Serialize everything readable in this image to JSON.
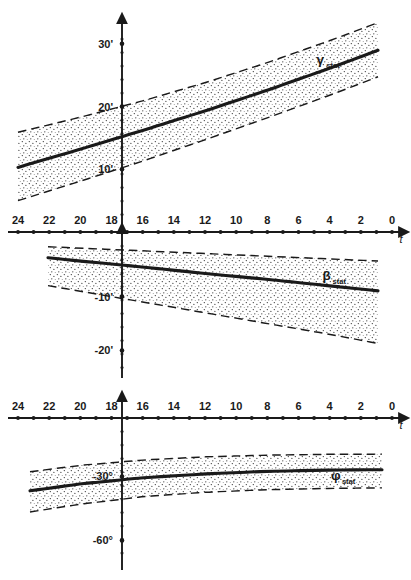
{
  "figure": {
    "background": "#ffffff",
    "ink": "#1a1a1a",
    "panel_count": 3
  },
  "chart_data": [
    {
      "type": "line",
      "name": "gamma-stat-panel",
      "title": "",
      "xlabel": "t",
      "ylabel": "",
      "series_label": "γ",
      "series_label_sub": "stat",
      "xlim": [
        24,
        0
      ],
      "ylim": [
        0,
        33
      ],
      "x_reversed": true,
      "grid": false,
      "legend_position": "inline-right",
      "y_unit": "arcminute",
      "y_ticks": [
        10,
        20,
        30
      ],
      "y_tick_labels": [
        "10'",
        "20'",
        "30'"
      ],
      "x_ticks": [
        24,
        23,
        22,
        21,
        20,
        19,
        18,
        17,
        16,
        15,
        14,
        13,
        12,
        11,
        10,
        9,
        8,
        7,
        6,
        5,
        4,
        3,
        2,
        1,
        0
      ],
      "x_tick_labels_shown": [
        24,
        22,
        20,
        18,
        16,
        14,
        12,
        10,
        8,
        6,
        4,
        2,
        0
      ],
      "x": [
        24,
        20,
        16,
        12,
        8,
        4,
        0
      ],
      "values": [
        10.3,
        13.2,
        16.2,
        19.3,
        22.6,
        26.1,
        29.8
      ],
      "band_upper": [
        15.9,
        18.3,
        20.9,
        23.8,
        27.0,
        30.5,
        34.2
      ],
      "band_lower": [
        5.0,
        8.1,
        11.3,
        14.7,
        18.2,
        21.8,
        25.6
      ],
      "band_style": "stippled-dotted",
      "band_edge_style": "dashed",
      "line_style": "solid-thick"
    },
    {
      "type": "line",
      "name": "beta-stat-panel",
      "title": "",
      "xlabel": "t",
      "ylabel": "",
      "series_label": "β",
      "series_label_sub": "stat",
      "xlim": [
        24,
        0
      ],
      "ylim": [
        -24,
        2
      ],
      "x_reversed": true,
      "grid": false,
      "legend_position": "inline-right",
      "y_unit": "arcminute",
      "y_ticks": [
        -10,
        -20
      ],
      "y_tick_labels": [
        "-10'",
        "-20'"
      ],
      "x_ticks": [
        24,
        23,
        22,
        21,
        20,
        19,
        18,
        17,
        16,
        15,
        14,
        13,
        12,
        11,
        10,
        9,
        8,
        7,
        6,
        5,
        4,
        3,
        2,
        1,
        0
      ],
      "x_tick_labels_shown": [
        24,
        22,
        20,
        18,
        16,
        14,
        12,
        10,
        8,
        6,
        4,
        2,
        0
      ],
      "x": [
        24,
        20,
        16,
        12,
        8,
        4,
        0
      ],
      "values": [
        -2.2,
        -3.4,
        -4.5,
        -5.7,
        -6.8,
        -8.0,
        -9.2
      ],
      "band_upper": [
        -0.5,
        -1.0,
        -1.5,
        -2.0,
        -2.5,
        -3.0,
        -3.5
      ],
      "band_lower": [
        -7.0,
        -9.0,
        -11.0,
        -13.0,
        -15.0,
        -17.0,
        -19.2
      ],
      "band_style": "stippled-dotted",
      "band_edge_style": "dashed",
      "line_style": "solid-thick"
    },
    {
      "type": "line",
      "name": "phi-stat-panel",
      "title": "",
      "xlabel": "t",
      "ylabel": "",
      "series_label": "φ",
      "series_label_sub": "stat",
      "xlim": [
        24,
        0
      ],
      "ylim": [
        -72,
        4
      ],
      "x_reversed": true,
      "grid": false,
      "legend_position": "inline-right",
      "y_unit": "degree",
      "y_ticks": [
        -30,
        -60
      ],
      "y_tick_labels": [
        "-30°",
        "-60°"
      ],
      "x_ticks": [
        24,
        23,
        22,
        21,
        20,
        19,
        18,
        17,
        16,
        15,
        14,
        13,
        12,
        11,
        10,
        9,
        8,
        7,
        6,
        5,
        4,
        3,
        2,
        1,
        0
      ],
      "x_tick_labels_shown": [
        24,
        22,
        20,
        18,
        16,
        14,
        12,
        10,
        8,
        6,
        4,
        2,
        0
      ],
      "x": [
        24,
        20,
        16,
        12,
        8,
        4,
        0
      ],
      "values": [
        -37.5,
        -33.5,
        -30.6,
        -28.8,
        -27.6,
        -27.0,
        -26.8
      ],
      "band_upper": [
        -28.5,
        -24.8,
        -22.3,
        -20.8,
        -20.0,
        -19.6,
        -19.5
      ],
      "band_lower": [
        -47.5,
        -43.0,
        -39.5,
        -37.4,
        -36.2,
        -35.6,
        -35.3
      ],
      "band_style": "stippled-dotted",
      "band_edge_style": "dashed",
      "line_style": "solid-thick"
    }
  ]
}
